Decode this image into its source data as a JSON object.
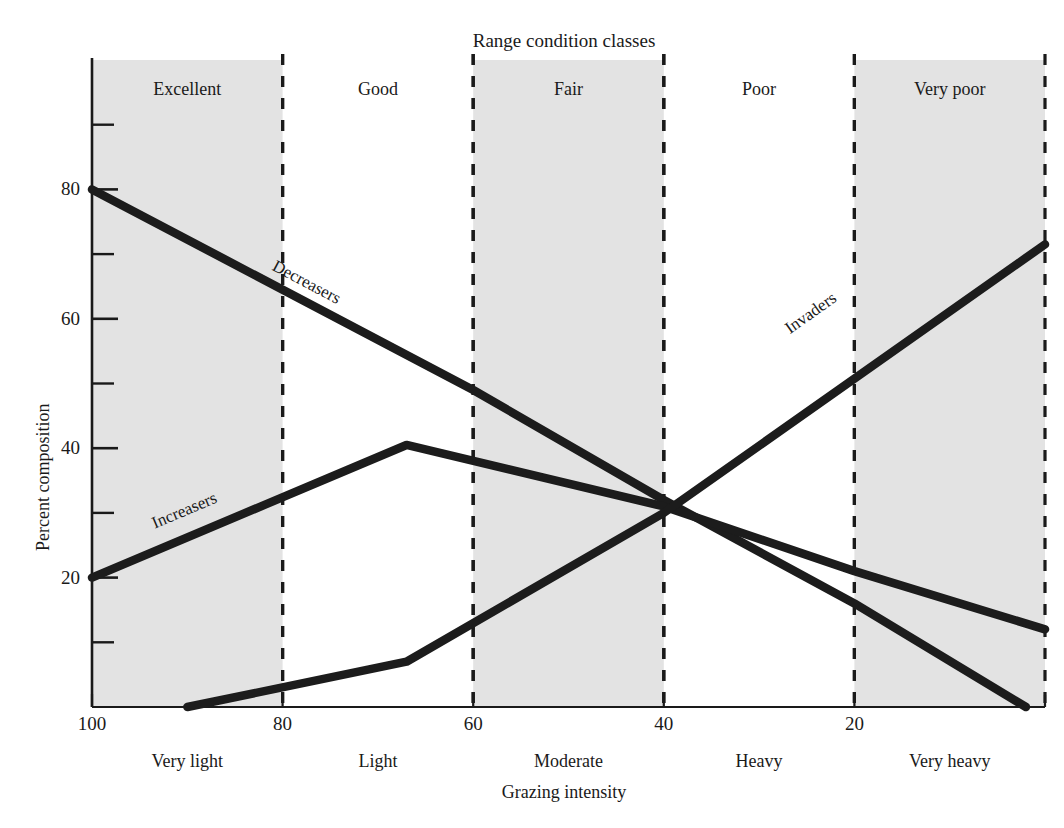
{
  "chart_data": {
    "type": "line",
    "title": "Range condition classes",
    "xlabel": "Grazing intensity",
    "ylabel": "Percent composition",
    "xlim": [
      100,
      0
    ],
    "ylim": [
      0,
      100
    ],
    "x_axis_reversed": true,
    "grid": false,
    "legend": "inline-labels",
    "x_major_ticks": [
      100,
      80,
      60,
      40,
      20
    ],
    "x_tick_labels": [
      "100",
      "80",
      "60",
      "40",
      "20"
    ],
    "y_major_ticks": [
      20,
      40,
      60,
      80
    ],
    "y_tick_labels": [
      "20",
      "40",
      "60",
      "80"
    ],
    "y_minor_ticks": [
      10,
      30,
      50,
      70,
      90
    ],
    "condition_classes": [
      {
        "label": "Excellent",
        "x_from": 100,
        "x_to": 80,
        "shaded": true
      },
      {
        "label": "Good",
        "x_from": 80,
        "x_to": 60,
        "shaded": false
      },
      {
        "label": "Fair",
        "x_from": 60,
        "x_to": 40,
        "shaded": true
      },
      {
        "label": "Poor",
        "x_from": 40,
        "x_to": 20,
        "shaded": false
      },
      {
        "label": "Very poor",
        "x_from": 20,
        "x_to": 0,
        "shaded": true
      }
    ],
    "grazing_intensity_classes": [
      {
        "label": "Very light",
        "x_center": 90
      },
      {
        "label": "Light",
        "x_center": 70
      },
      {
        "label": "Moderate",
        "x_center": 50
      },
      {
        "label": "Heavy",
        "x_center": 30
      },
      {
        "label": "Very heavy",
        "x_center": 10
      }
    ],
    "series": [
      {
        "name": "Decreasers",
        "label_x": 77,
        "label_y": 66,
        "points": [
          {
            "x": 100,
            "y": 80
          },
          {
            "x": 60,
            "y": 49
          },
          {
            "x": 40,
            "y": 32
          },
          {
            "x": 20,
            "y": 16
          },
          {
            "x": 2,
            "y": 0
          }
        ]
      },
      {
        "name": "Increasers",
        "label_x": 90,
        "label_y": 26,
        "points": [
          {
            "x": 100,
            "y": 20
          },
          {
            "x": 67,
            "y": 40.5
          },
          {
            "x": 40,
            "y": 31
          },
          {
            "x": 20,
            "y": 21
          },
          {
            "x": 0,
            "y": 12
          }
        ]
      },
      {
        "name": "Invaders",
        "label_x": 24,
        "label_y": 56,
        "points": [
          {
            "x": 90,
            "y": 0
          },
          {
            "x": 67,
            "y": 7
          },
          {
            "x": 40,
            "y": 30
          },
          {
            "x": 0,
            "y": 71.5
          }
        ]
      }
    ],
    "colors": {
      "band_shade": "#e3e3e3",
      "line": "#1c1c1c",
      "axis": "#1a1a1a",
      "dashed_divider": "#1a1a1a",
      "background": "#ffffff"
    }
  }
}
